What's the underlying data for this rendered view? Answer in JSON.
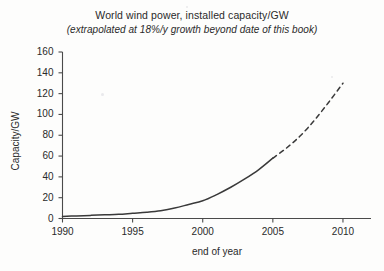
{
  "chart_data": {
    "type": "line",
    "title": "World wind power, installed capacity/GW",
    "subtitle": "(extrapolated at 18%/y growth beyond date of this book)",
    "xlabel": "end of year",
    "ylabel": "Capacity/GW",
    "xlim": [
      1990,
      2012
    ],
    "ylim": [
      0,
      160
    ],
    "xticks": [
      1990,
      1995,
      2000,
      2005,
      2010
    ],
    "xtick_labels": [
      "1990",
      "1995",
      "2000",
      "2005",
      "2010"
    ],
    "yticks": [
      0,
      20,
      40,
      60,
      80,
      100,
      120,
      140,
      160
    ],
    "ytick_labels": [
      "0",
      "20",
      "40",
      "60",
      "80",
      "100",
      "120",
      "140",
      "160"
    ],
    "grid": false,
    "legend": false,
    "growth_rate_percent_per_year": 18,
    "series": [
      {
        "name": "Installed capacity (historical)",
        "style": "solid",
        "color": "#3a3a3a",
        "x": [
          1990,
          1991,
          1992,
          1993,
          1994,
          1995,
          1996,
          1997,
          1998,
          1999,
          2000,
          2001,
          2002,
          2003,
          2004,
          2005
        ],
        "values": [
          2,
          2.5,
          3,
          3.5,
          4,
          5,
          6,
          7.5,
          10,
          13.5,
          17,
          23,
          30,
          38,
          47,
          58
        ]
      },
      {
        "name": "Extrapolation at 18%/y",
        "style": "dashed",
        "color": "#3a3a3a",
        "x": [
          2005,
          2006,
          2007,
          2008,
          2009,
          2010
        ],
        "values": [
          58,
          68,
          80,
          95,
          112,
          130
        ]
      }
    ]
  },
  "axes": {
    "y_axis_name": "capacity-axis",
    "x_axis_name": "year-axis"
  }
}
